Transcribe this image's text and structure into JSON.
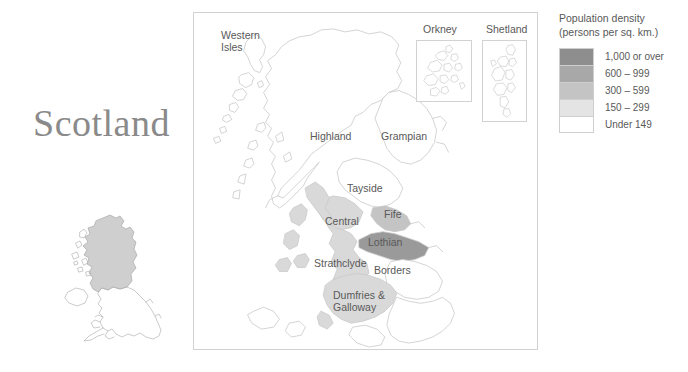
{
  "title": "Scotland",
  "map": {
    "frame_label": "scotland-choropleth",
    "insets": [
      {
        "name": "Orkney",
        "label": "Orkney"
      },
      {
        "name": "Shetland",
        "label": "Shetland"
      }
    ],
    "regions": [
      {
        "name": "western-isles",
        "label": "Western Isles",
        "label_line1": "Western",
        "label_line2": "Isles",
        "band": "Under 149",
        "fill": "#ffffff"
      },
      {
        "name": "highland",
        "label": "Highland",
        "label_line1": "Highland",
        "label_line2": "",
        "band": "Under 149",
        "fill": "#ffffff"
      },
      {
        "name": "grampian",
        "label": "Grampian",
        "label_line1": "Grampian",
        "label_line2": "",
        "band": "Under 149",
        "fill": "#ffffff"
      },
      {
        "name": "tayside",
        "label": "Tayside",
        "label_line1": "Tayside",
        "label_line2": "",
        "band": "Under 149",
        "fill": "#ffffff"
      },
      {
        "name": "central",
        "label": "Central",
        "label_line1": "Central",
        "label_line2": "",
        "band": "150 - 299",
        "fill": "#d9d9d9"
      },
      {
        "name": "fife",
        "label": "Fife",
        "label_line1": "Fife",
        "label_line2": "",
        "band": "300 - 599",
        "fill": "#c4c4c4"
      },
      {
        "name": "lothian",
        "label": "Lothian",
        "label_line1": "Lothian",
        "label_line2": "",
        "band": "1,000 or over",
        "fill": "#9a9a9a"
      },
      {
        "name": "strathclyde",
        "label": "Strathclyde",
        "label_line1": "Strathclyde",
        "label_line2": "",
        "band": "150 - 299",
        "fill": "#d9d9d9"
      },
      {
        "name": "borders",
        "label": "Borders",
        "label_line1": "Borders",
        "label_line2": "",
        "band": "Under 149",
        "fill": "#ffffff"
      },
      {
        "name": "dumfries-and-galloway",
        "label": "Dumfries & Galloway",
        "label_line1": "Dumfries &",
        "label_line2": "Galloway",
        "band": "150 - 299",
        "fill": "#d9d9d9"
      }
    ]
  },
  "legend": {
    "title_line1": "Population density",
    "title_line2": "(persons per sq. km.)",
    "entries": [
      {
        "label": "1,000 or over",
        "color": "#8e8e8e"
      },
      {
        "label": "600 – 999",
        "color": "#a8a8a8"
      },
      {
        "label": "300 – 599",
        "color": "#c4c4c4"
      },
      {
        "label": "150 – 299",
        "color": "#e4e4e4"
      },
      {
        "label": "Under 149",
        "color": "#ffffff"
      }
    ]
  },
  "locator": {
    "name": "uk-locator-map",
    "highlight_color": "#cfcfcf",
    "outline_color": "#b0b0b0"
  },
  "colors": {
    "background": "#ffffff",
    "frame_border": "#d2d2d2",
    "coastline": "#c9c9c9",
    "text": "#595959",
    "title_text": "#8a8a8a"
  }
}
